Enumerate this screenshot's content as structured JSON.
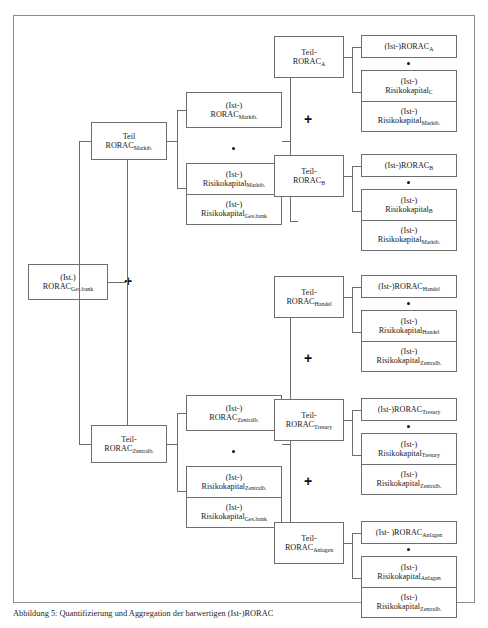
{
  "figure": {
    "caption_prefix": "Abbildung 5:",
    "caption_text": "Quantifizierung und Aggregation der barwertigen (Ist-)RORAC"
  },
  "symbols": {
    "plus": "+",
    "multiply_dot": "•"
  },
  "nodes": {
    "root": {
      "line1": "(Ist.)",
      "line2_base": "RORAC",
      "line2_sub": "Ges.bank"
    },
    "level1": [
      {
        "id": "teil-rorac-marktb",
        "line1": "Teil",
        "line2_base": "RORAC",
        "line2_sub": "Marktb."
      },
      {
        "id": "teil-rorac-zentralb",
        "line1": "Teil-",
        "line2_base": "RORAC",
        "line2_sub": "Zentralb."
      }
    ],
    "level2_terms": [
      {
        "id": "term-marktb",
        "factor": {
          "line1": "(Ist-)",
          "line2_base": "RORAC",
          "line2_sub": "Marktb."
        },
        "fraction": {
          "num_line1": "(Ist-)",
          "num_base": "Risikokapital",
          "num_sub": "Marktb.",
          "den_line1": "(Ist-)",
          "den_base": "Risikokapital",
          "den_sub": "Ges.bank"
        }
      },
      {
        "id": "term-zentralb",
        "factor": {
          "line1": "(Ist-)",
          "line2_base": "RORAC",
          "line2_sub": "Zentralb."
        },
        "fraction": {
          "num_line1": "(Ist-)",
          "num_base": "Risikokapital",
          "num_sub": "Zentralb.",
          "den_line1": "(Ist-)",
          "den_base": "Risikokapital",
          "den_sub": "Ges.bank"
        }
      }
    ],
    "level3": [
      {
        "id": "teil-rorac-a",
        "line1": "Teil-",
        "line2_base": "RORAC",
        "line2_sub": "A"
      },
      {
        "id": "teil-rorac-b",
        "line1": "Teil-",
        "line2_base": "RORAC",
        "line2_sub": "B"
      },
      {
        "id": "teil-rorac-handel",
        "line1": "Teil-",
        "line2_base": "RORAC",
        "line2_sub": "Handel"
      },
      {
        "id": "teil-rorac-tresury",
        "line1": "Teil-",
        "line2_base": "RORAC",
        "line2_sub": "Tresury"
      },
      {
        "id": "teil-rorac-anlagen",
        "line1": "Teil-",
        "line2_base": "RORAC",
        "line2_sub": "Anlagen"
      }
    ],
    "level4_terms": [
      {
        "id": "term-a",
        "factor_inline": "(Ist-)RORAC",
        "factor_sub": "A",
        "fraction": {
          "num_line1": "(Ist-)",
          "num_base": "Risikokapital",
          "num_sub": "C",
          "den_line1": "(Ist-)",
          "den_base": "Risikokapital",
          "den_sub": "Marktb."
        }
      },
      {
        "id": "term-b",
        "factor_inline": "(Ist-)RORAC",
        "factor_sub": "B",
        "fraction": {
          "num_line1": "(Ist-)",
          "num_base": "Risikokapital",
          "num_sub": "B",
          "den_line1": "(Ist-)",
          "den_base": "Risikokapital",
          "den_sub": "Marktb."
        }
      },
      {
        "id": "term-handel",
        "factor_inline": "(Ist-)RORAC",
        "factor_sub": "Handel",
        "fraction": {
          "num_line1": "(Ist-)",
          "num_base": "Risikokapital",
          "num_sub": "Handel",
          "den_line1": "(Ist-)",
          "den_base": "Risikokapital",
          "den_sub": "Zentralb."
        }
      },
      {
        "id": "term-tresury",
        "factor_inline": "(Ist-)RORAC",
        "factor_sub": "Tresury",
        "fraction": {
          "num_line1": "(Ist-)",
          "num_base": "Risikokapital",
          "num_sub": "Tresury",
          "den_line1": "(Ist-)",
          "den_base": "Risikokapital",
          "den_sub": "Zentralb."
        }
      },
      {
        "id": "term-anlagen",
        "factor_inline": "(Ist- )RORAC",
        "factor_sub": "Anlagen",
        "fraction": {
          "num_line1": "(Ist-)",
          "num_base": "Risikokapital",
          "num_sub": "Anlagen",
          "den_line1": "(Ist-)",
          "den_base": "Risikokapital",
          "den_sub": "Zentralb."
        }
      }
    ]
  },
  "colors": {
    "frame_border": "#8c8c8c",
    "box_border": "#6e6e6e",
    "text": "#1a1a1a",
    "background": "#ffffff"
  }
}
